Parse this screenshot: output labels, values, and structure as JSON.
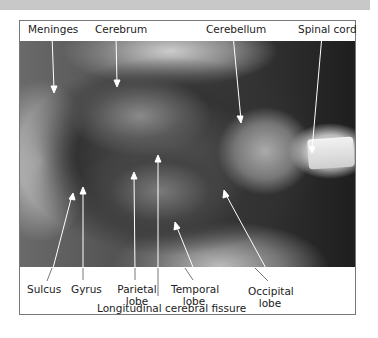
{
  "figure": {
    "type": "labeled anatomical photograph",
    "labels_top": {
      "meninges": "Meninges",
      "cerebrum": "Cerebrum",
      "cerebellum": "Cerebellum",
      "spinal_cord": "Spinal cord"
    },
    "labels_bottom": {
      "sulcus": "Sulcus",
      "gyrus": "Gyrus",
      "parietal_line1": "Parietal",
      "parietal_line2": "lobe",
      "temporal_line1": "Temporal",
      "temporal_line2": "lobe",
      "occipital_line1": "Occipital",
      "occipital_line2": "lobe",
      "fissure": "Longitudinal cerebral fissure"
    }
  }
}
